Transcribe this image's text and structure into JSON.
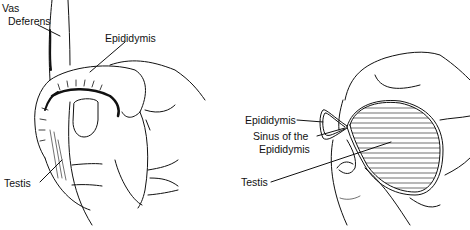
{
  "figure": {
    "left_panel": {
      "labels": {
        "vas_line1": "Vas",
        "vas_line2": "Deferens",
        "epididymis": "Epididymis",
        "testis": "Testis"
      }
    },
    "right_panel": {
      "labels": {
        "epididymis": "Epididymis",
        "sinus_line1": "Sinus of the",
        "sinus_line2": "Epididymis",
        "testis": "Testis"
      }
    }
  }
}
